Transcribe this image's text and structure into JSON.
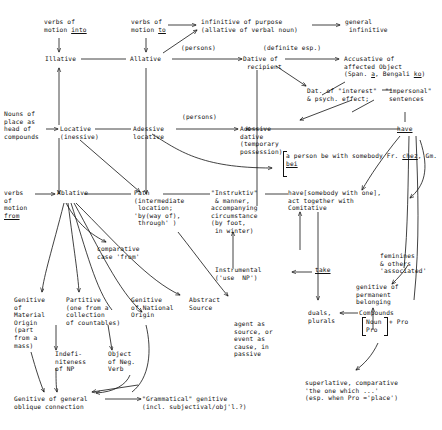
{
  "diagram": {
    "nodes": {
      "verbs_motion_into": "verbs of\nmotion into",
      "verbs_motion_to": "verbs of\nmotion to",
      "infinitive_purpose": "infinitive of purpose\n(allative of verbal noun)",
      "general_infinitive": "general\ninfinitive",
      "illative": "Illative",
      "allative": "Allative",
      "persons_top": "(persons)",
      "definite_esp": "(definite esp.)",
      "dative_recipient": "Dative of\nrecipient",
      "accusative_affected": "Accusative of\naffected Object\n(Span. a, Bengali ko)",
      "dat_interest": "Dat. of \"interest\"\n& psych. effect;",
      "impersonal_sentences": "\"impersonal\"\nsentences",
      "nouns_of_place": "Nouns of\nplace as\nhead of\ncompounds",
      "locative": "Locative\n(inessive)",
      "adessive_locative": "Adessive\nlocative",
      "persons_mid": "(persons)",
      "adessive_dative": "Adessive\ndative\n(temporary\npossession)",
      "have": "have",
      "person_box": "a person\nbe with somebody\nFr. chez, Gm. bei",
      "verbs_motion_from": "verbs\nof\nmotion\nfrom",
      "ablative": "Ablative",
      "path": "Path\n(intermediate\n location;\n'by(way of),\n through' )",
      "instruktiv": "\"Instruktiv\"\n& manner,\naccompanying\ncircumstance\n(by foot,\n in winter)",
      "have_somebody": "have[somebody with one],\nact together with\nComitative",
      "feminines": "feminines\n& others\n'associated'",
      "comparative_case": "comparative\ncase 'from'",
      "instrumental": "Instrumental\n('use  NP')",
      "take": "take",
      "genitive_material": "Genitive\nof\nMaterial\nOrigin\n(part\nfrom a\nmass)",
      "partitive": "Partitive\n(one from a\ncollection\nof countables)",
      "genitive_national": "Genitive\nof National\nOrigin",
      "abstract_source": "Abstract\nSource",
      "indefiniteness": "Indefi-\nniteness\nof NP",
      "object_neg_verb": "Object\nof Neg.\nVerb",
      "agent_as_source": "agent as\nsource, or\nevent as\ncause, in\npassive",
      "duals_plurals": "duals,\nplurals",
      "compounds": "Compounds",
      "compounds_brace_top": "Noun",
      "compounds_brace_bottom": "Pro",
      "compounds_plus": "+ Pro",
      "genitive_permanent": "genitive of\npermanent\nbelonging",
      "superlative": "superlative, comparative\n'the one which ...'\n(esp. when Pro ='place')",
      "genitive_general": "Genitive of general\noblique connection",
      "grammatical_genitive": "\"Grammatical\" genitive\n(incl. subjectival/obj'l.?)"
    },
    "colors": {
      "ink": "#111111",
      "paper": "#ffffff"
    }
  }
}
